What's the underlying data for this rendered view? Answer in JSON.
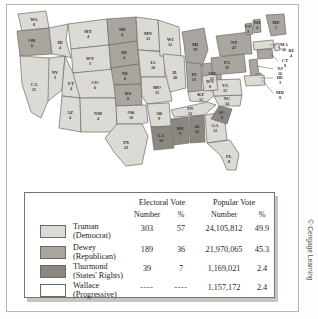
{
  "figure": {
    "credit": "© Cengage Learning",
    "colors": {
      "truman": "#dcdad5",
      "dewey": "#a9a6a0",
      "thurmond": "#8b8882",
      "wallace": "#ffffff",
      "state_border": "#6e6a64",
      "label_text": "#2a2a28"
    }
  },
  "map": {
    "title": "Presidential Election of 1948 Electoral Map",
    "states": [
      {
        "abbr": "WA",
        "votes": "8",
        "winner": "truman",
        "x": 27,
        "y": 17,
        "lx": 27,
        "ly": 17
      },
      {
        "abbr": "OR",
        "votes": "6",
        "winner": "dewey",
        "x": 21,
        "y": 38,
        "lx": 21,
        "ly": 38
      },
      {
        "abbr": "CA",
        "votes": "25",
        "winner": "truman",
        "x": 26,
        "y": 84,
        "lx": 26,
        "ly": 84
      },
      {
        "abbr": "NV",
        "votes": "3",
        "winner": "truman",
        "x": 46,
        "y": 70,
        "lx": 46,
        "ly": 70
      },
      {
        "abbr": "ID",
        "votes": "4",
        "winner": "truman",
        "x": 50,
        "y": 42,
        "lx": 50,
        "ly": 42
      },
      {
        "abbr": "MT",
        "votes": "4",
        "winner": "truman",
        "x": 80,
        "y": 26,
        "lx": 80,
        "ly": 26
      },
      {
        "abbr": "WY",
        "votes": "3",
        "winner": "truman",
        "x": 76,
        "y": 56,
        "lx": 76,
        "ly": 56
      },
      {
        "abbr": "UT",
        "votes": "4",
        "winner": "truman",
        "x": 64,
        "y": 80,
        "lx": 64,
        "ly": 80
      },
      {
        "abbr": "CO",
        "votes": "6",
        "winner": "truman",
        "x": 90,
        "y": 82,
        "lx": 90,
        "ly": 82
      },
      {
        "abbr": "AZ",
        "votes": "4",
        "winner": "truman",
        "x": 62,
        "y": 110,
        "lx": 62,
        "ly": 110
      },
      {
        "abbr": "NM",
        "votes": "4",
        "winner": "truman",
        "x": 90,
        "y": 112,
        "lx": 90,
        "ly": 112
      },
      {
        "abbr": "ND",
        "votes": "4",
        "winner": "dewey",
        "x": 112,
        "y": 26,
        "lx": 112,
        "ly": 26
      },
      {
        "abbr": "SD",
        "votes": "4",
        "winner": "dewey",
        "x": 112,
        "y": 47,
        "lx": 112,
        "ly": 47
      },
      {
        "abbr": "NE",
        "votes": "6",
        "winner": "dewey",
        "x": 112,
        "y": 68,
        "lx": 112,
        "ly": 68
      },
      {
        "abbr": "KS",
        "votes": "8",
        "winner": "dewey",
        "x": 114,
        "y": 90,
        "lx": 114,
        "ly": 90
      },
      {
        "abbr": "OK",
        "votes": "10",
        "winner": "truman",
        "x": 119,
        "y": 110,
        "lx": 119,
        "ly": 110
      },
      {
        "abbr": "TX",
        "votes": "23",
        "winner": "truman",
        "x": 110,
        "y": 137,
        "lx": 110,
        "ly": 137
      },
      {
        "abbr": "MN",
        "votes": "11",
        "winner": "truman",
        "x": 139,
        "y": 31,
        "lx": 139,
        "ly": 31
      },
      {
        "abbr": "IA",
        "votes": "10",
        "winner": "truman",
        "x": 143,
        "y": 62,
        "lx": 143,
        "ly": 62
      },
      {
        "abbr": "MO",
        "votes": "15",
        "winner": "truman",
        "x": 149,
        "y": 86,
        "lx": 149,
        "ly": 86
      },
      {
        "abbr": "AR",
        "votes": "9",
        "winner": "truman",
        "x": 148,
        "y": 111,
        "lx": 148,
        "ly": 111
      },
      {
        "abbr": "LA",
        "votes": "10",
        "winner": "thurmond",
        "x": 151,
        "y": 136,
        "lx": 151,
        "ly": 136
      },
      {
        "abbr": "WI",
        "votes": "12",
        "winner": "truman",
        "x": 161,
        "y": 40,
        "lx": 161,
        "ly": 40
      },
      {
        "abbr": "IL",
        "votes": "28",
        "winner": "truman",
        "x": 168,
        "y": 70,
        "lx": 168,
        "ly": 70
      },
      {
        "abbr": "MI",
        "votes": "19",
        "winner": "dewey",
        "x": 186,
        "y": 45,
        "lx": 186,
        "ly": 45
      },
      {
        "abbr": "IN",
        "votes": "13",
        "winner": "dewey",
        "x": 183,
        "y": 72,
        "lx": 183,
        "ly": 72
      },
      {
        "abbr": "OH",
        "votes": "25",
        "winner": "dewey",
        "x": 199,
        "y": 70,
        "lx": 199,
        "ly": 70
      },
      {
        "abbr": "KY",
        "votes": "11",
        "winner": "truman",
        "x": 186,
        "y": 89,
        "lx": 186,
        "ly": 89
      },
      {
        "abbr": "TN",
        "votes": "12",
        "winner": "truman",
        "x": 180,
        "y": 102,
        "lx": 180,
        "ly": 102
      },
      {
        "abbr": "MS",
        "votes": "9",
        "winner": "thurmond",
        "x": 169,
        "y": 122,
        "lx": 169,
        "ly": 122
      },
      {
        "abbr": "AL",
        "votes": "11",
        "winner": "thurmond",
        "x": 184,
        "y": 123,
        "lx": 184,
        "ly": 123
      },
      {
        "abbr": "GA",
        "votes": "12",
        "winner": "truman",
        "x": 202,
        "y": 123,
        "lx": 202,
        "ly": 123
      },
      {
        "abbr": "FL",
        "votes": "8",
        "winner": "truman",
        "x": 221,
        "y": 152,
        "lx": 221,
        "ly": 152
      },
      {
        "abbr": "SC",
        "votes": "8",
        "winner": "thurmond",
        "x": 215,
        "y": 111,
        "lx": 215,
        "ly": 111
      },
      {
        "abbr": "NC",
        "votes": "14",
        "winner": "truman",
        "x": 216,
        "y": 96,
        "lx": 216,
        "ly": 96
      },
      {
        "abbr": "VA",
        "votes": "11",
        "winner": "truman",
        "x": 213,
        "y": 79,
        "lx": 213,
        "ly": 79
      },
      {
        "abbr": "WV",
        "votes": "8",
        "winner": "truman",
        "x": 199,
        "y": 82,
        "lx": 199,
        "ly": 82
      },
      {
        "abbr": "PA",
        "votes": "35",
        "winner": "dewey",
        "x": 219,
        "y": 60,
        "lx": 219,
        "ly": 60
      },
      {
        "abbr": "NY",
        "votes": "47",
        "winner": "dewey",
        "x": 227,
        "y": 41,
        "lx": 227,
        "ly": 41
      },
      {
        "abbr": "VT",
        "votes": "3",
        "winner": "dewey",
        "x": 240,
        "y": 25,
        "lx": 240,
        "ly": 25
      },
      {
        "abbr": "NH",
        "votes": "4",
        "winner": "dewey",
        "x": 253,
        "y": 18,
        "lx": 253,
        "ly": 18
      },
      {
        "abbr": "ME",
        "votes": "5",
        "winner": "dewey",
        "x": 270,
        "y": 19,
        "lx": 270,
        "ly": 19
      },
      {
        "abbr": "MA",
        "votes": "16",
        "winner": "truman",
        "x": 268,
        "y": 42,
        "lx": 268,
        "ly": 42
      },
      {
        "abbr": "RI",
        "votes": "4",
        "winner": "truman",
        "x": 275,
        "y": 52,
        "lx": 275,
        "ly": 52
      },
      {
        "abbr": "CT",
        "votes": "8",
        "winner": "dewey",
        "x": 268,
        "y": 60,
        "lx": 268,
        "ly": 60
      },
      {
        "abbr": "NJ",
        "votes": "16",
        "winner": "dewey",
        "x": 262,
        "y": 71,
        "lx": 262,
        "ly": 71
      },
      {
        "abbr": "DE",
        "votes": "3",
        "winner": "dewey",
        "x": 262,
        "y": 82,
        "lx": 262,
        "ly": 82
      },
      {
        "abbr": "MD",
        "votes": "8",
        "winner": "truman",
        "x": 262,
        "y": 92,
        "lx": 262,
        "ly": 92
      }
    ]
  },
  "legend": {
    "group_headers": {
      "electoral": "Electoral Vote",
      "popular": "Popular Vote"
    },
    "sub_headers": {
      "ev_number": "Number",
      "ev_pct": "%",
      "pv_number": "Number",
      "pv_pct": "%"
    },
    "rows": [
      {
        "swatch": "truman",
        "name": "Truman",
        "party": "(Democrat)",
        "ev_number": "303",
        "ev_pct": "57",
        "pv_number": "24,105,812",
        "pv_pct": "49.9"
      },
      {
        "swatch": "dewey",
        "name": "Dewey",
        "party": "(Republican)",
        "ev_number": "189",
        "ev_pct": "36",
        "pv_number": "21,970,065",
        "pv_pct": "45.3"
      },
      {
        "swatch": "thurmond",
        "name": "Thurmond",
        "party": "(States' Rights)",
        "ev_number": "39",
        "ev_pct": "7",
        "pv_number": "1,169,021",
        "pv_pct": "2.4"
      },
      {
        "swatch": "wallace",
        "name": "Wallace",
        "party": "(Progressive)",
        "ev_number": "----",
        "ev_pct": "----",
        "pv_number": "1,157,172",
        "pv_pct": "2.4"
      }
    ]
  },
  "chart_data": {
    "type": "table",
    "columns": [
      "Candidate",
      "Electoral Vote Number",
      "Electoral Vote %",
      "Popular Vote Number",
      "Popular Vote %"
    ],
    "rows": [
      [
        "Truman (Democrat)",
        303,
        57,
        24105812,
        49.9
      ],
      [
        "Dewey (Republican)",
        189,
        36,
        21970065,
        45.3
      ],
      [
        "Thurmond (States' Rights)",
        39,
        7,
        1169021,
        2.4
      ],
      [
        "Wallace (Progressive)",
        null,
        null,
        1157172,
        2.4
      ]
    ]
  }
}
